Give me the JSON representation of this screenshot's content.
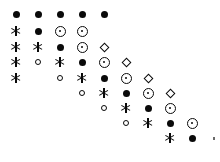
{
  "chart_data": {
    "type": "scatter",
    "title": "",
    "subtitle": "",
    "xlabel": "",
    "ylabel": "",
    "grid": false,
    "legend": null,
    "background_color": "#ffffff",
    "marker_color": "#0a0a0a",
    "axes_visible": false,
    "tick_labels_x": [],
    "tick_labels_y": [],
    "xlim": [
      0,
      10
    ],
    "ylim": [
      0,
      10
    ],
    "col_count": 10,
    "row_count": 9,
    "col_x_px": [
      16,
      38,
      60,
      82,
      104,
      126,
      148,
      170,
      192,
      214
    ],
    "row_y_px": [
      14,
      31,
      47,
      62,
      78,
      93,
      108,
      123,
      138
    ],
    "symbol_legend": [
      {
        "key": "filled-circle",
        "glyph": "●",
        "name": "filled-circle"
      },
      {
        "key": "asterisk",
        "glyph": "✳",
        "name": "asterisk"
      },
      {
        "key": "circle-dot",
        "glyph": "⊙",
        "name": "circle-dot"
      },
      {
        "key": "open-circle",
        "glyph": "○",
        "name": "open-circle"
      },
      {
        "key": "diamond",
        "glyph": "◇",
        "name": "diamond"
      },
      {
        "key": "speck",
        "glyph": "·",
        "name": "speck"
      }
    ],
    "points": [
      {
        "row": 0,
        "col": 0,
        "symbol": "filled-circle"
      },
      {
        "row": 0,
        "col": 1,
        "symbol": "filled-circle"
      },
      {
        "row": 0,
        "col": 2,
        "symbol": "filled-circle"
      },
      {
        "row": 0,
        "col": 3,
        "symbol": "filled-circle"
      },
      {
        "row": 0,
        "col": 4,
        "symbol": "filled-circle"
      },
      {
        "row": 1,
        "col": 0,
        "symbol": "asterisk"
      },
      {
        "row": 1,
        "col": 1,
        "symbol": "filled-circle"
      },
      {
        "row": 1,
        "col": 2,
        "symbol": "circle-dot"
      },
      {
        "row": 1,
        "col": 3,
        "symbol": "circle-dot"
      },
      {
        "row": 2,
        "col": 0,
        "symbol": "asterisk"
      },
      {
        "row": 2,
        "col": 1,
        "symbol": "asterisk"
      },
      {
        "row": 2,
        "col": 2,
        "symbol": "filled-circle"
      },
      {
        "row": 2,
        "col": 3,
        "symbol": "circle-dot"
      },
      {
        "row": 2,
        "col": 4,
        "symbol": "diamond"
      },
      {
        "row": 3,
        "col": 0,
        "symbol": "asterisk"
      },
      {
        "row": 3,
        "col": 1,
        "symbol": "open-circle"
      },
      {
        "row": 3,
        "col": 2,
        "symbol": "asterisk"
      },
      {
        "row": 3,
        "col": 3,
        "symbol": "filled-circle"
      },
      {
        "row": 3,
        "col": 4,
        "symbol": "circle-dot"
      },
      {
        "row": 3,
        "col": 5,
        "symbol": "diamond"
      },
      {
        "row": 4,
        "col": 0,
        "symbol": "asterisk"
      },
      {
        "row": 4,
        "col": 2,
        "symbol": "open-circle"
      },
      {
        "row": 4,
        "col": 3,
        "symbol": "asterisk"
      },
      {
        "row": 4,
        "col": 4,
        "symbol": "filled-circle"
      },
      {
        "row": 4,
        "col": 5,
        "symbol": "circle-dot"
      },
      {
        "row": 4,
        "col": 6,
        "symbol": "diamond"
      },
      {
        "row": 5,
        "col": 3,
        "symbol": "open-circle"
      },
      {
        "row": 5,
        "col": 4,
        "symbol": "asterisk"
      },
      {
        "row": 5,
        "col": 5,
        "symbol": "filled-circle"
      },
      {
        "row": 5,
        "col": 6,
        "symbol": "circle-dot"
      },
      {
        "row": 5,
        "col": 7,
        "symbol": "diamond"
      },
      {
        "row": 6,
        "col": 4,
        "symbol": "open-circle"
      },
      {
        "row": 6,
        "col": 5,
        "symbol": "asterisk"
      },
      {
        "row": 6,
        "col": 6,
        "symbol": "filled-circle"
      },
      {
        "row": 6,
        "col": 7,
        "symbol": "circle-dot"
      },
      {
        "row": 7,
        "col": 5,
        "symbol": "open-circle"
      },
      {
        "row": 7,
        "col": 6,
        "symbol": "asterisk"
      },
      {
        "row": 7,
        "col": 7,
        "symbol": "filled-circle"
      },
      {
        "row": 7,
        "col": 8,
        "symbol": "circle-dot"
      },
      {
        "row": 8,
        "col": 7,
        "symbol": "asterisk"
      },
      {
        "row": 8,
        "col": 8,
        "symbol": "filled-circle"
      },
      {
        "row": 8,
        "col": 9,
        "symbol": "speck"
      }
    ]
  }
}
